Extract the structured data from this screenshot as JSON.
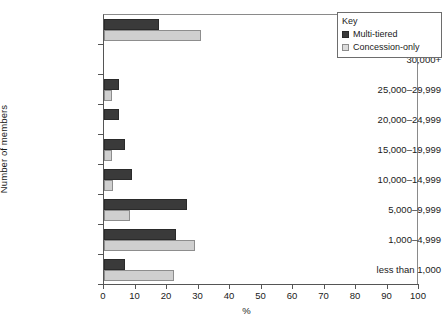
{
  "chart_data": {
    "type": "bar",
    "orientation": "horizontal",
    "title": "",
    "xlabel": "%",
    "ylabel": "Number of members",
    "xlim": [
      0,
      100
    ],
    "xticks": [
      0,
      10,
      20,
      30,
      40,
      50,
      60,
      70,
      80,
      90,
      100
    ],
    "grid": false,
    "legend_position": "top-right",
    "legend_title": "Key",
    "categories": [
      "N/A",
      "30,000+",
      "25,000–29,999",
      "20,000–24,999",
      "15,000–19,999",
      "10,000–14,999",
      "5,000–9,999",
      "1,000–4,999",
      "less than 1,000"
    ],
    "series": [
      {
        "name": "Multi-tiered",
        "color": "#3a3a3a",
        "values": [
          17.5,
          0,
          4.8,
          4.8,
          6.8,
          8.8,
          26.5,
          22.8,
          6.8
        ]
      },
      {
        "name": "Concession-only",
        "color": "#cfcfcf",
        "values": [
          30.8,
          0,
          2.6,
          0,
          2.6,
          2.7,
          8.2,
          28.8,
          22.2
        ]
      }
    ]
  }
}
